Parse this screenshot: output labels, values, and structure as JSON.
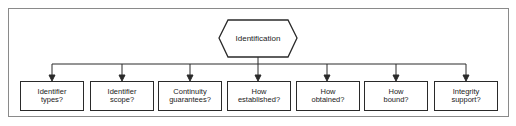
{
  "diagram": {
    "type": "tree",
    "root": {
      "label": "Identification",
      "shape": "hexagon"
    },
    "children": [
      {
        "line1": "Identifier",
        "line2": "types?"
      },
      {
        "line1": "Identifier",
        "line2": "scope?"
      },
      {
        "line1": "Continuity",
        "line2": "guarantees?"
      },
      {
        "line1": "How",
        "line2": "established?"
      },
      {
        "line1": "How",
        "line2": "obtained?"
      },
      {
        "line1": "How",
        "line2": "bound?"
      },
      {
        "line1": "Integrity",
        "line2": "support?"
      }
    ],
    "colors": {
      "stroke": "#2a2a2a",
      "frame": "#8a8a8a",
      "text": "#222222",
      "background": "#ffffff"
    }
  }
}
